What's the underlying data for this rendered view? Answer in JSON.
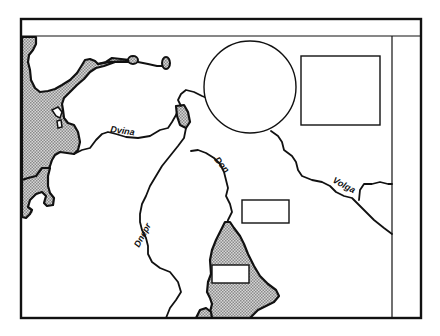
{
  "map": {
    "width": 440,
    "height": 336,
    "colors": {
      "ink": "#111111",
      "paper": "#ffffff",
      "water_pattern": "stippled gray"
    },
    "rivers": [
      {
        "name": "Dvina",
        "label": "Dvina"
      },
      {
        "name": "Dnepr",
        "label": "Dnepr"
      },
      {
        "name": "Don",
        "label": "Don"
      },
      {
        "name": "Volga",
        "label": "Volga"
      }
    ],
    "placeholders": {
      "circle": "empty circle (inset placeholder)",
      "box_upper_right": "empty rectangle (top right)",
      "box_middle": "empty rectangle (center)",
      "box_sea": "empty rectangle (on sea, bottom)"
    },
    "frame": {
      "header_band": "empty title band",
      "right_margin": "empty side column"
    }
  }
}
